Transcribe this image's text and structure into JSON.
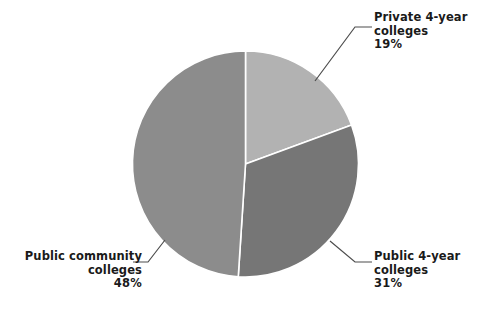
{
  "chart_data": {
    "type": "pie",
    "title": "",
    "subtitle": "",
    "xlabel": "",
    "ylabel": "",
    "categories": [
      "Private 4-year colleges",
      "Public 4-year colleges",
      "Public community colleges"
    ],
    "values": [
      19,
      31,
      48
    ],
    "value_labels": [
      "19%",
      "31%",
      "48%"
    ],
    "unit": "%",
    "slice_colors": [
      "#b2b2b2",
      "#767676",
      "#8c8c8c"
    ],
    "start_angle_deg": 0,
    "direction": "clockwise",
    "legend": "none",
    "labels_position": "callout-leader-lines",
    "grid": false,
    "background": "#ffffff",
    "slices": [
      {
        "name": "Private 4-year colleges",
        "label_line1": "Private 4-year",
        "label_line2": "colleges",
        "percent_text": "19%",
        "value": 19,
        "color": "#b2b2b2"
      },
      {
        "name": "Public 4-year colleges",
        "label_line1": "Public 4-year",
        "label_line2": "colleges",
        "percent_text": "31%",
        "value": 31,
        "color": "#767676"
      },
      {
        "name": "Public community colleges",
        "label_line1": "Public community",
        "label_line2": "colleges",
        "percent_text": "48%",
        "value": 48,
        "color": "#8c8c8c"
      }
    ]
  }
}
